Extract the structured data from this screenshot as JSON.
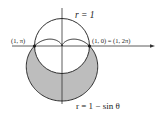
{
  "figure": {
    "width": 160,
    "height": 120,
    "origin": [
      62,
      46
    ],
    "scale": 27.5,
    "colors": {
      "stroke": "#1a1a1a",
      "shade": "#bdbdbd",
      "axis": "#333333",
      "background": "#ffffff"
    },
    "axes": {
      "horizontal": {
        "x1": 12,
        "x2": 155,
        "y": 46
      },
      "vertical": {
        "x": 62,
        "y1": 8,
        "y2": 104
      }
    },
    "curves": [
      {
        "name": "circle",
        "equation": "r = 1"
      },
      {
        "name": "cardioid",
        "equation": "r = 1 − sin θ"
      }
    ],
    "shaded_region": "inside cardioid r = 1 − sin θ, outside circle r = 1",
    "labels": {
      "circle": "r = 1",
      "cardioid": "r = 1 − sin θ",
      "left_point": "(1, π)",
      "right_point": "(1, 0) = (1, 2π)"
    },
    "points": [
      {
        "name": "left-intersection",
        "polar": "(1, π)"
      },
      {
        "name": "right-intersection",
        "polar": "(1, 0) = (1, 2π)"
      }
    ]
  }
}
